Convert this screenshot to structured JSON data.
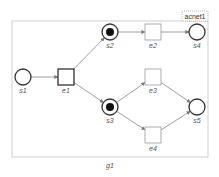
{
  "diagram": {
    "net_label": "acnet1",
    "group_label": "g1",
    "colors": {
      "border": "#cfcfcf",
      "node": "#333333",
      "arc": "#888888",
      "token": "#111111",
      "transition": "#999999"
    },
    "places": [
      {
        "id": "s1",
        "label": "s1",
        "x": 23,
        "y": 77,
        "marked": false
      },
      {
        "id": "s2",
        "label": "s2",
        "x": 110,
        "y": 32,
        "marked": true
      },
      {
        "id": "s3",
        "label": "s3",
        "x": 110,
        "y": 107,
        "marked": true
      },
      {
        "id": "s4",
        "label": "s4",
        "x": 197,
        "y": 32,
        "marked": false
      },
      {
        "id": "s5",
        "label": "s5",
        "x": 197,
        "y": 107,
        "marked": false
      }
    ],
    "transitions": [
      {
        "id": "e1",
        "label": "e1",
        "x": 66,
        "y": 77
      },
      {
        "id": "e2",
        "label": "e2",
        "x": 153,
        "y": 32
      },
      {
        "id": "e3",
        "label": "e3",
        "x": 153,
        "y": 77
      },
      {
        "id": "e4",
        "label": "e4",
        "x": 153,
        "y": 135
      }
    ],
    "arcs": [
      [
        "s1",
        "e1"
      ],
      [
        "e1",
        "s2"
      ],
      [
        "e1",
        "s3"
      ],
      [
        "s2",
        "e2"
      ],
      [
        "e2",
        "s4"
      ],
      [
        "s3",
        "e3"
      ],
      [
        "s3",
        "e4"
      ],
      [
        "e3",
        "s5"
      ],
      [
        "e4",
        "s5"
      ]
    ]
  }
}
